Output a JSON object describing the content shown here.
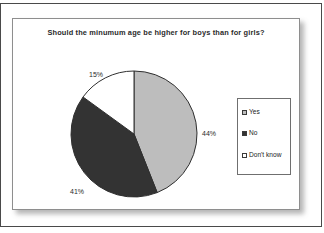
{
  "chart_data": {
    "type": "pie",
    "title": "Should the minumum age be higher for boys than for girls?",
    "categories": [
      "Yes",
      "No",
      "Don't know"
    ],
    "values": [
      44,
      41,
      15
    ],
    "value_labels": [
      "44%",
      "41%",
      "15%"
    ],
    "unit": "%",
    "start_angle_deg": 0,
    "direction": "clockwise",
    "colors": [
      "#bdbdbd",
      "#333333",
      "#ffffff"
    ],
    "slice_outline_color": "#2f2f2f",
    "legend": {
      "position": "right",
      "entries": [
        {
          "label": "Yes",
          "swatch_color": "#bdbdbd"
        },
        {
          "label": "No",
          "swatch_color": "#333333"
        },
        {
          "label": "Don't know",
          "swatch_color": "#ffffff"
        }
      ]
    },
    "grid": false,
    "xlabel": "",
    "ylabel": ""
  },
  "panel": {
    "background": "#ffffff",
    "border_color": "#8e8e8e"
  },
  "frame": {
    "border_color": "#4a4a4a"
  }
}
